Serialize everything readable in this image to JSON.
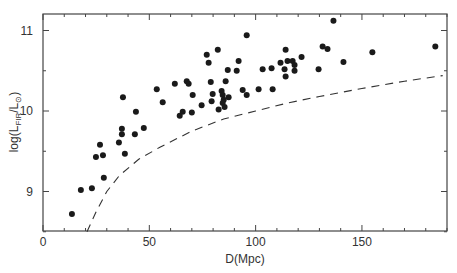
{
  "chart_data": {
    "type": "scatter",
    "title": "",
    "xlabel": "D(Mpc)",
    "ylabel": "log(L_FIR/L_⊙)",
    "ylabel_parts": {
      "prefix": "log(L",
      "sub1": "FIR",
      "mid": "/L",
      "sub2": "⊙",
      "suffix": ")"
    },
    "xlim": [
      0,
      190
    ],
    "ylim": [
      8.5,
      11.2
    ],
    "xticks": [
      0,
      50,
      100,
      150
    ],
    "xtick_labels": [
      "0",
      "50",
      "100",
      "150"
    ],
    "yticks": [
      9,
      10,
      11
    ],
    "ytick_labels": [
      "9",
      "10",
      "11"
    ],
    "grid": false,
    "legend": null,
    "series": [
      {
        "name": "galaxies",
        "style": "filled-circle",
        "points": [
          [
            13.6,
            8.72
          ],
          [
            17.8,
            9.02
          ],
          [
            23.0,
            9.04
          ],
          [
            28.6,
            9.17
          ],
          [
            24.9,
            9.43
          ],
          [
            26.8,
            9.58
          ],
          [
            28.2,
            9.45
          ],
          [
            35.7,
            9.61
          ],
          [
            37.1,
            9.71
          ],
          [
            37.1,
            9.78
          ],
          [
            38.5,
            9.47
          ],
          [
            43.2,
            9.71
          ],
          [
            43.7,
            9.99
          ],
          [
            47.4,
            9.79
          ],
          [
            37.6,
            10.17
          ],
          [
            53.5,
            10.27
          ],
          [
            56.3,
            10.11
          ],
          [
            62.0,
            10.34
          ],
          [
            67.6,
            10.37
          ],
          [
            68.5,
            10.34
          ],
          [
            70.4,
            10.2
          ],
          [
            64.3,
            9.94
          ],
          [
            65.7,
            9.99
          ],
          [
            70.0,
            9.98
          ],
          [
            74.6,
            10.07
          ],
          [
            77.0,
            10.7
          ],
          [
            77.9,
            10.6
          ],
          [
            82.2,
            10.76
          ],
          [
            78.9,
            10.36
          ],
          [
            79.3,
            10.12
          ],
          [
            79.8,
            10.21
          ],
          [
            84.0,
            10.25
          ],
          [
            84.5,
            10.2
          ],
          [
            85.0,
            10.14
          ],
          [
            85.9,
            10.37
          ],
          [
            86.9,
            10.51
          ],
          [
            87.3,
            10.17
          ],
          [
            84.5,
            10.1
          ],
          [
            85.4,
            10.05
          ],
          [
            82.6,
            10.02
          ],
          [
            92.0,
            10.62
          ],
          [
            91.1,
            10.5
          ],
          [
            93.9,
            10.26
          ],
          [
            95.8,
            10.2
          ],
          [
            101.4,
            10.27
          ],
          [
            95.8,
            10.94
          ],
          [
            103.3,
            10.52
          ],
          [
            107.5,
            10.53
          ],
          [
            108.0,
            10.27
          ],
          [
            114.1,
            10.76
          ],
          [
            111.7,
            10.6
          ],
          [
            115.0,
            10.62
          ],
          [
            117.4,
            10.62
          ],
          [
            118.3,
            10.57
          ],
          [
            121.6,
            10.67
          ],
          [
            113.6,
            10.52
          ],
          [
            118.3,
            10.5
          ],
          [
            114.1,
            10.43
          ],
          [
            129.6,
            10.52
          ],
          [
            131.5,
            10.8
          ],
          [
            133.8,
            10.77
          ],
          [
            136.6,
            11.12
          ],
          [
            141.3,
            10.61
          ],
          [
            154.9,
            10.73
          ],
          [
            184.5,
            10.8
          ]
        ]
      },
      {
        "name": "detection limit",
        "style": "dashed-line",
        "points": [
          [
            20.7,
            8.5
          ],
          [
            25,
            8.75
          ],
          [
            30,
            9.0
          ],
          [
            36,
            9.2
          ],
          [
            45,
            9.4
          ],
          [
            55,
            9.55
          ],
          [
            70,
            9.75
          ],
          [
            85,
            9.9
          ],
          [
            100,
            10.0
          ],
          [
            115,
            10.1
          ],
          [
            130,
            10.18
          ],
          [
            150,
            10.28
          ],
          [
            170,
            10.37
          ],
          [
            188,
            10.44
          ]
        ]
      }
    ]
  }
}
